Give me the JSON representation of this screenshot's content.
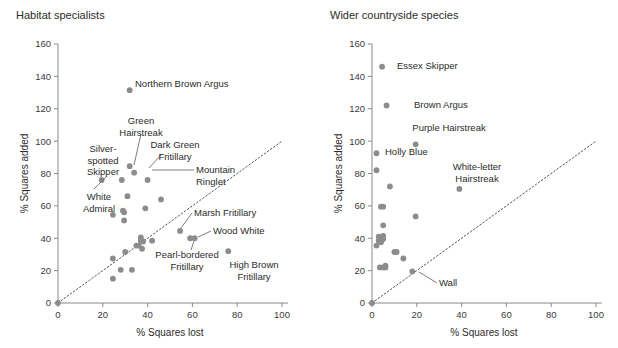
{
  "figure": {
    "width": 618,
    "height": 348,
    "point_color": "#8c8c8c",
    "axis_color": "#8a8a8a",
    "text_color": "#2b2b2b"
  },
  "chart_data": [
    {
      "type": "scatter",
      "panel": "left",
      "title": "Habitat specialists",
      "xlabel": "% Squares lost",
      "ylabel": "% Squares added",
      "xlim": [
        0,
        100
      ],
      "ylim": [
        0,
        160
      ],
      "xticks": [
        0,
        20,
        40,
        60,
        80,
        100
      ],
      "yticks": [
        0,
        20,
        40,
        60,
        80,
        100,
        120,
        140,
        160
      ],
      "grid": false,
      "legend": "none",
      "reference_line": {
        "kind": "identity",
        "style": "dotted",
        "from": [
          0,
          0
        ],
        "to": [
          100,
          100
        ]
      },
      "points": [
        {
          "x": 0,
          "y": 0,
          "label": null
        },
        {
          "x": 19.5,
          "y": 76,
          "label": "Silver-spotted Skipper"
        },
        {
          "x": 24.5,
          "y": 54.5,
          "label": null
        },
        {
          "x": 24.5,
          "y": 27.5,
          "label": null
        },
        {
          "x": 24.5,
          "y": 15,
          "label": null
        },
        {
          "x": 28,
          "y": 20.5,
          "label": null
        },
        {
          "x": 28.5,
          "y": 76,
          "label": null
        },
        {
          "x": 29,
          "y": 57,
          "label": null
        },
        {
          "x": 29.5,
          "y": 56,
          "label": null
        },
        {
          "x": 29.5,
          "y": 51,
          "label": null
        },
        {
          "x": 30,
          "y": 31.5,
          "label": null
        },
        {
          "x": 31,
          "y": 66,
          "label": null
        },
        {
          "x": 32,
          "y": 84.5,
          "label": "Green Hairstreak"
        },
        {
          "x": 32,
          "y": 131.5,
          "label": "Northern Brown Argus"
        },
        {
          "x": 33,
          "y": 20.5,
          "label": null
        },
        {
          "x": 34,
          "y": 80.5,
          "label": "Dark Green Fritillary"
        },
        {
          "x": 35,
          "y": 35.5,
          "label": null
        },
        {
          "x": 36,
          "y": 35.5,
          "label": null
        },
        {
          "x": 37,
          "y": 40.5,
          "label": null
        },
        {
          "x": 37,
          "y": 38.5,
          "label": null
        },
        {
          "x": 37.5,
          "y": 33.5,
          "label": null
        },
        {
          "x": 38,
          "y": 38,
          "label": null
        },
        {
          "x": 39,
          "y": 58.5,
          "label": null
        },
        {
          "x": 40,
          "y": 76,
          "label": "Mountain Ringlet"
        },
        {
          "x": 42,
          "y": 38.5,
          "label": null
        },
        {
          "x": 46,
          "y": 64,
          "label": null
        },
        {
          "x": 54.5,
          "y": 44.5,
          "label": "Marsh Fritillary"
        },
        {
          "x": 59,
          "y": 40,
          "label": "Pearl-bordered Fritillary"
        },
        {
          "x": 61,
          "y": 40,
          "label": "Wood White"
        },
        {
          "x": 76,
          "y": 32,
          "label": "High Brown Fritillary"
        }
      ],
      "annotations": [
        {
          "text": "Northern Brown Argus",
          "lines": [
            "Northern Brown Argus"
          ],
          "anchor": "start"
        },
        {
          "text": "Green Hairstreak",
          "lines": [
            "Green",
            "Hairstreak"
          ],
          "anchor": "middle"
        },
        {
          "text": "Silver-spotted Skipper",
          "lines": [
            "Silver-",
            "spotted",
            "Skipper"
          ],
          "anchor": "middle"
        },
        {
          "text": "Dark Green Fritillary",
          "lines": [
            "Dark Green",
            "Fritillary"
          ],
          "anchor": "middle"
        },
        {
          "text": "Mountain Ringlet",
          "lines": [
            "Mountain",
            "Ringlet"
          ],
          "anchor": "middle"
        },
        {
          "text": "White Admiral",
          "lines": [
            "White",
            "Admiral"
          ],
          "anchor": "middle"
        },
        {
          "text": "Marsh Fritillary",
          "lines": [
            "Marsh Fritillary"
          ],
          "anchor": "start"
        },
        {
          "text": "Wood White",
          "lines": [
            "Wood White"
          ],
          "anchor": "start"
        },
        {
          "text": "Pearl-bordered Fritillary",
          "lines": [
            "Pearl-bordered",
            "Fritillary"
          ],
          "anchor": "middle"
        },
        {
          "text": "High Brown Fritillary",
          "lines": [
            "High Brown",
            "Fritillary"
          ],
          "anchor": "middle"
        }
      ]
    },
    {
      "type": "scatter",
      "panel": "right",
      "title": "Wider countryside species",
      "xlabel": "% Squares lost",
      "ylabel": "% Squares added",
      "xlim": [
        0,
        100
      ],
      "ylim": [
        0,
        160
      ],
      "xticks": [
        0,
        20,
        40,
        60,
        80,
        100
      ],
      "yticks": [
        0,
        20,
        40,
        60,
        80,
        100,
        120,
        140,
        160
      ],
      "grid": false,
      "legend": "none",
      "reference_line": {
        "kind": "identity",
        "style": "dotted",
        "from": [
          0,
          0
        ],
        "to": [
          100,
          100
        ]
      },
      "points": [
        {
          "x": 0,
          "y": 0,
          "label": null
        },
        {
          "x": 2,
          "y": 92.5,
          "label": "Holly Blue"
        },
        {
          "x": 2,
          "y": 82,
          "label": null
        },
        {
          "x": 2,
          "y": 35.5,
          "label": null
        },
        {
          "x": 3,
          "y": 38.5,
          "label": null
        },
        {
          "x": 3,
          "y": 41,
          "label": null
        },
        {
          "x": 3.5,
          "y": 22,
          "label": null
        },
        {
          "x": 4,
          "y": 59.5,
          "label": null
        },
        {
          "x": 4,
          "y": 39,
          "label": null
        },
        {
          "x": 4,
          "y": 37.5,
          "label": null
        },
        {
          "x": 4.5,
          "y": 146,
          "label": "Essex Skipper"
        },
        {
          "x": 5,
          "y": 59.5,
          "label": null
        },
        {
          "x": 5,
          "y": 48,
          "label": null
        },
        {
          "x": 5,
          "y": 41.5,
          "label": null
        },
        {
          "x": 5,
          "y": 39.5,
          "label": null
        },
        {
          "x": 5,
          "y": 22,
          "label": null
        },
        {
          "x": 6,
          "y": 22,
          "label": null
        },
        {
          "x": 6,
          "y": 23,
          "label": null
        },
        {
          "x": 6.5,
          "y": 122,
          "label": "Brown Argus"
        },
        {
          "x": 8,
          "y": 72,
          "label": null
        },
        {
          "x": 10,
          "y": 31.5,
          "label": null
        },
        {
          "x": 11,
          "y": 31.5,
          "label": null
        },
        {
          "x": 14,
          "y": 27.5,
          "label": null
        },
        {
          "x": 19.5,
          "y": 98,
          "label": "Purple Hairstreak"
        },
        {
          "x": 19.5,
          "y": 53.5,
          "label": null
        },
        {
          "x": 18,
          "y": 19.5,
          "label": "Wall"
        },
        {
          "x": 39,
          "y": 70.5,
          "label": "White-letter Hairstreak"
        }
      ],
      "annotations": [
        {
          "text": "Essex Skipper",
          "lines": [
            "Essex Skipper"
          ],
          "anchor": "start"
        },
        {
          "text": "Brown Argus",
          "lines": [
            "Brown Argus"
          ],
          "anchor": "start"
        },
        {
          "text": "Purple Hairstreak",
          "lines": [
            "Purple Hairstreak"
          ],
          "anchor": "middle"
        },
        {
          "text": "Holly Blue",
          "lines": [
            "Holly Blue"
          ],
          "anchor": "start"
        },
        {
          "text": "White-letter Hairstreak",
          "lines": [
            "White-letter",
            "Hairstreak"
          ],
          "anchor": "middle"
        },
        {
          "text": "Wall",
          "lines": [
            "Wall"
          ],
          "anchor": "start"
        }
      ]
    }
  ]
}
